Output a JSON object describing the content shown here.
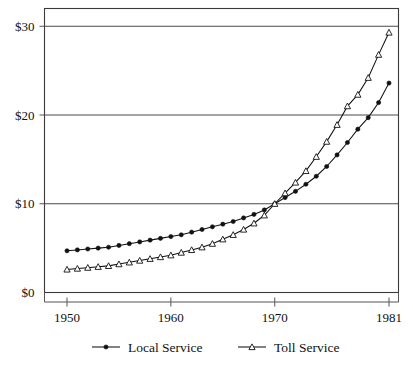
{
  "chart_data": {
    "type": "line",
    "title": "",
    "subtitle": "",
    "xlabel": "",
    "ylabel": "",
    "xlim": [
      1950,
      1981
    ],
    "ylim": [
      0,
      32
    ],
    "grid": true,
    "legend_position": "bottom",
    "x_ticks": [
      1950,
      1960,
      1970,
      1981
    ],
    "x_tick_labels": [
      "1950",
      "1960",
      "1970",
      "1981"
    ],
    "y_ticks": [
      0,
      10,
      20,
      30
    ],
    "y_tick_labels": [
      "$0",
      "$10",
      "$20",
      "$30"
    ],
    "x": [
      1950,
      1951,
      1952,
      1953,
      1954,
      1955,
      1956,
      1957,
      1958,
      1959,
      1960,
      1961,
      1962,
      1963,
      1964,
      1965,
      1966,
      1967,
      1968,
      1969,
      1970,
      1971,
      1972,
      1973,
      1974,
      1975,
      1976,
      1977,
      1978,
      1979,
      1980,
      1981
    ],
    "series": [
      {
        "name": "Local Service",
        "marker": "filled-circle",
        "values": [
          4.7,
          4.8,
          4.9,
          5.0,
          5.1,
          5.3,
          5.5,
          5.7,
          5.9,
          6.1,
          6.3,
          6.5,
          6.8,
          7.1,
          7.4,
          7.7,
          8.0,
          8.4,
          8.8,
          9.3,
          10.0,
          10.7,
          11.4,
          12.2,
          13.1,
          14.2,
          15.5,
          16.9,
          18.4,
          19.7,
          21.4,
          23.6
        ]
      },
      {
        "name": "Toll Service",
        "marker": "open-triangle",
        "values": [
          2.6,
          2.7,
          2.8,
          2.9,
          3.0,
          3.2,
          3.4,
          3.6,
          3.8,
          4.0,
          4.2,
          4.5,
          4.8,
          5.1,
          5.5,
          6.0,
          6.5,
          7.1,
          7.8,
          8.7,
          10.0,
          11.2,
          12.4,
          13.7,
          15.3,
          17.0,
          18.9,
          21.0,
          22.3,
          24.2,
          26.8,
          29.3
        ]
      }
    ]
  },
  "legend": {
    "items": [
      {
        "label": "Local Service",
        "marker": "filled-circle"
      },
      {
        "label": "Toll Service",
        "marker": "open-triangle"
      }
    ]
  },
  "colors": {
    "line": "#111111",
    "grid": "#4a4a4a",
    "frame": "#3a3a3a",
    "background": "#ffffff"
  }
}
